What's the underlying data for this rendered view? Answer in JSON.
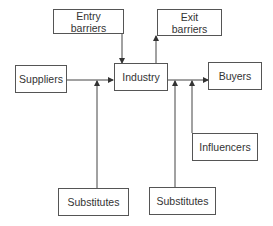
{
  "diagram": {
    "nodes": {
      "entry_barriers": {
        "line1": "Entry",
        "line2": "barriers"
      },
      "exit_barriers": {
        "line1": "Exit",
        "line2": "barriers"
      },
      "suppliers": {
        "label": "Suppliers"
      },
      "industry": {
        "label": "Industry"
      },
      "buyers": {
        "label": "Buyers"
      },
      "influencers": {
        "label": "Influencers"
      },
      "substitutes_left": {
        "label": "Substitutes"
      },
      "substitutes_right": {
        "label": "Substitutes"
      }
    },
    "edges": [
      {
        "from": "Suppliers",
        "to": "Industry"
      },
      {
        "from": "Entry barriers",
        "to": "Industry"
      },
      {
        "from": "Industry",
        "to": "Exit barriers"
      },
      {
        "from": "Industry",
        "to": "Buyers"
      },
      {
        "from": "Substitutes (left)",
        "to": "Suppliers→Industry flow"
      },
      {
        "from": "Substitutes (right)",
        "to": "Industry→Buyers flow"
      },
      {
        "from": "Influencers",
        "to": "Industry→Buyers flow"
      }
    ],
    "colors": {
      "line": "#444444",
      "border": "#555555",
      "text": "#333333"
    }
  }
}
